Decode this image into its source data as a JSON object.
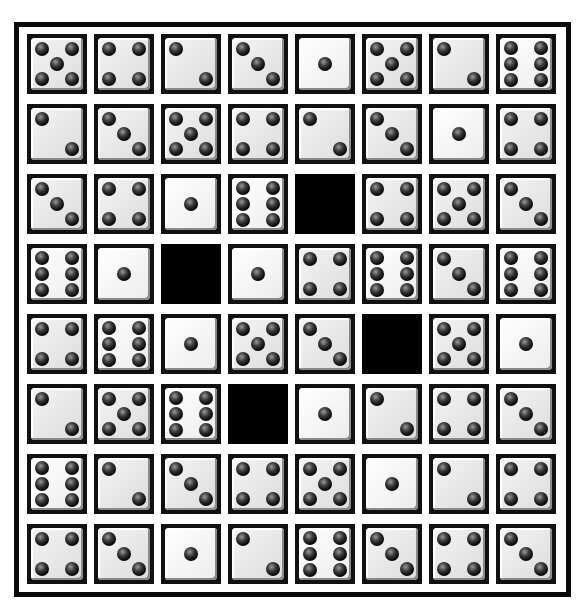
{
  "game": {
    "type": "dice-grid-puzzle",
    "rows": 8,
    "cols": 8,
    "legend": "0 = blank black cell; 1-6 = die face value",
    "grid": [
      [
        5,
        4,
        2,
        3,
        1,
        5,
        2,
        6
      ],
      [
        2,
        3,
        5,
        4,
        2,
        3,
        1,
        4
      ],
      [
        3,
        4,
        1,
        6,
        0,
        4,
        5,
        3
      ],
      [
        6,
        1,
        0,
        1,
        4,
        6,
        3,
        6
      ],
      [
        4,
        6,
        1,
        5,
        3,
        0,
        5,
        1
      ],
      [
        2,
        5,
        6,
        0,
        1,
        2,
        4,
        3
      ],
      [
        6,
        2,
        3,
        4,
        5,
        1,
        2,
        4
      ],
      [
        4,
        3,
        1,
        2,
        6,
        3,
        4,
        3
      ]
    ]
  },
  "colors": {
    "frame": "#0a0a0a",
    "background": "#ffffff",
    "die_face": "#e4e4e4",
    "pip": "#050505",
    "blank": "#000000"
  }
}
